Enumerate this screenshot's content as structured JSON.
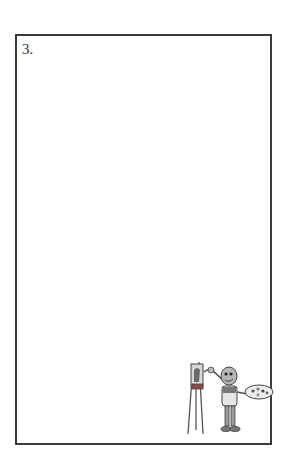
{
  "page": {
    "item_number": "3.",
    "illustration": "robot-painter-at-easel-icon",
    "colors": {
      "background": "#ffffff",
      "frame_border": "#3a3a3a",
      "text": "#333333"
    }
  }
}
